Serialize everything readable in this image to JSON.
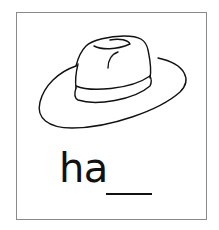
{
  "card": {
    "illustration": "hat",
    "word_prefix": "ha",
    "blank_count": 1
  },
  "colors": {
    "border": "#8a8a8a",
    "ink": "#111111",
    "background": "#ffffff"
  }
}
